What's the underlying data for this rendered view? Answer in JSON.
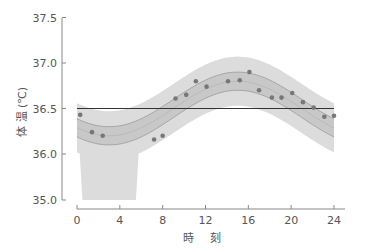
{
  "chart_data": {
    "type": "scatter",
    "title": "",
    "xlabel": "時 刻",
    "ylabel": "体 温 (℃)",
    "xlim": [
      0,
      24
    ],
    "ylim": [
      35.0,
      37.5
    ],
    "y_axis_break": true,
    "xticks": [
      0,
      4,
      8,
      12,
      16,
      20,
      24
    ],
    "yticks": [
      "35.0",
      "36.0",
      "36.5",
      "37.0",
      "37.5"
    ],
    "grid": false,
    "legend": null,
    "reference_line": {
      "y": 36.5,
      "label": "mesor",
      "color": "#333333"
    },
    "fitted_curve": {
      "model": "cosinor",
      "mesor": 36.5,
      "amplitude": 0.3,
      "acrophase_hour": 15,
      "period_hours": 24,
      "inner_band_halfwidth": 0.1,
      "outer_band_halfwidth": 0.27
    },
    "series": [
      {
        "name": "measured temperature",
        "x": [
          0.3,
          1.4,
          2.4,
          7.2,
          8.0,
          9.2,
          10.2,
          11.1,
          12.1,
          14.1,
          15.2,
          16.1,
          17.0,
          18.2,
          19.1,
          20.1,
          21.1,
          22.1,
          23.1,
          24.0
        ],
        "y": [
          36.43,
          36.24,
          36.2,
          36.16,
          36.2,
          36.61,
          36.65,
          36.8,
          36.74,
          36.8,
          36.81,
          36.9,
          36.7,
          36.62,
          36.62,
          36.67,
          36.57,
          36.51,
          36.41,
          36.42
        ]
      }
    ]
  },
  "colors": {
    "axis": "#888888",
    "text": "#555555",
    "outer_band": "#dcdcdc",
    "inner_band": "#c8c8c8",
    "band_edge": "#9a9a9a",
    "point": "#777777",
    "mesor_line": "#333333"
  }
}
